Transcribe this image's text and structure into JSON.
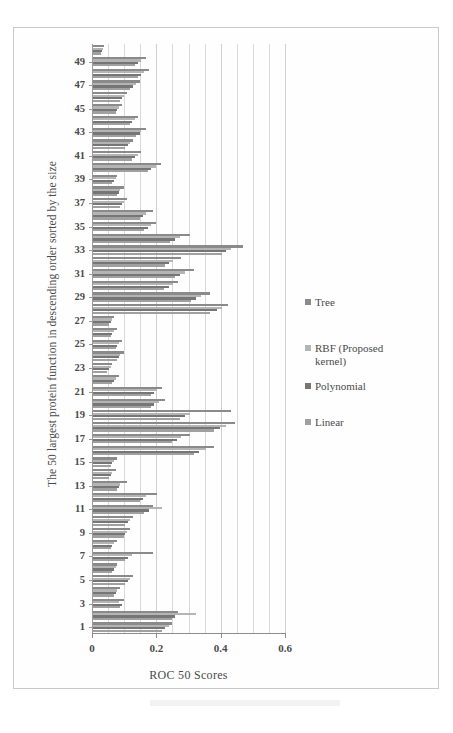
{
  "chart_data": {
    "type": "bar",
    "orientation": "horizontal",
    "title": "",
    "xlabel": "ROC 50 Scores",
    "ylabel": "The 50 largest protein function in descending order sorted by the size",
    "xlim": [
      0,
      0.6
    ],
    "xticks": [
      "0",
      "0.2",
      "0.4",
      "0.6"
    ],
    "xtick_values": [
      0,
      0.2,
      0.4,
      0.6
    ],
    "minor_gridline_step": 0.05,
    "grid": true,
    "legend_position": "right",
    "categories": [
      1,
      2,
      3,
      4,
      5,
      6,
      7,
      8,
      9,
      10,
      11,
      12,
      13,
      14,
      15,
      16,
      17,
      18,
      19,
      20,
      21,
      22,
      23,
      24,
      25,
      26,
      27,
      28,
      29,
      30,
      31,
      32,
      33,
      34,
      35,
      36,
      37,
      38,
      39,
      40,
      41,
      42,
      43,
      44,
      45,
      46,
      47,
      48,
      49,
      50
    ],
    "ytick_labels": [
      "1",
      "3",
      "5",
      "7",
      "9",
      "11",
      "13",
      "15",
      "17",
      "19",
      "21",
      "23",
      "25",
      "27",
      "29",
      "31",
      "33",
      "35",
      "37",
      "39",
      "41",
      "43",
      "45",
      "47",
      "49"
    ],
    "series": [
      {
        "name": "Tree",
        "color": "#8a8a8a",
        "values": [
          0.245,
          0.265,
          0.095,
          0.085,
          0.125,
          0.075,
          0.185,
          0.075,
          0.115,
          0.125,
          0.185,
          0.2,
          0.105,
          0.07,
          0.075,
          0.375,
          0.3,
          0.44,
          0.43,
          0.225,
          0.215,
          0.08,
          0.06,
          0.095,
          0.09,
          0.075,
          0.065,
          0.42,
          0.365,
          0.265,
          0.315,
          0.275,
          0.465,
          0.3,
          0.195,
          0.185,
          0.105,
          0.095,
          0.075,
          0.21,
          0.15,
          0.125,
          0.165,
          0.14,
          0.09,
          0.105,
          0.145,
          0.175,
          0.165,
          0.035
        ]
      },
      {
        "name": "RBF (Proposed kernel)",
        "color": "#b4b4b4",
        "values": [
          0.235,
          0.32,
          0.08,
          0.075,
          0.115,
          0.07,
          0.12,
          0.065,
          0.105,
          0.115,
          0.215,
          0.165,
          0.085,
          0.06,
          0.065,
          0.35,
          0.275,
          0.415,
          0.3,
          0.205,
          0.2,
          0.07,
          0.055,
          0.085,
          0.08,
          0.065,
          0.06,
          0.4,
          0.335,
          0.25,
          0.285,
          0.25,
          0.43,
          0.27,
          0.18,
          0.165,
          0.095,
          0.085,
          0.07,
          0.195,
          0.14,
          0.115,
          0.15,
          0.13,
          0.08,
          0.095,
          0.135,
          0.16,
          0.15,
          0.03
        ]
      },
      {
        "name": "Polynomial",
        "color": "#767676",
        "values": [
          0.225,
          0.255,
          0.09,
          0.07,
          0.11,
          0.065,
          0.11,
          0.06,
          0.1,
          0.11,
          0.175,
          0.155,
          0.08,
          0.055,
          0.06,
          0.33,
          0.26,
          0.395,
          0.285,
          0.19,
          0.19,
          0.065,
          0.05,
          0.08,
          0.075,
          0.06,
          0.055,
          0.385,
          0.32,
          0.235,
          0.27,
          0.235,
          0.415,
          0.255,
          0.17,
          0.155,
          0.09,
          0.08,
          0.065,
          0.18,
          0.13,
          0.11,
          0.145,
          0.12,
          0.075,
          0.09,
          0.125,
          0.15,
          0.14,
          0.028
        ]
      },
      {
        "name": "Linear",
        "color": "#a0a0a0",
        "values": [
          0.215,
          0.245,
          0.085,
          0.065,
          0.1,
          0.06,
          0.1,
          0.055,
          0.095,
          0.1,
          0.16,
          0.145,
          0.075,
          0.05,
          0.055,
          0.315,
          0.245,
          0.375,
          0.27,
          0.18,
          0.18,
          0.06,
          0.045,
          0.075,
          0.07,
          0.055,
          0.05,
          0.365,
          0.305,
          0.22,
          0.255,
          0.225,
          0.4,
          0.24,
          0.16,
          0.145,
          0.085,
          0.075,
          0.06,
          0.17,
          0.12,
          0.1,
          0.135,
          0.115,
          0.07,
          0.085,
          0.115,
          0.14,
          0.13,
          0.025
        ]
      }
    ]
  },
  "legend": {
    "entries": [
      {
        "label": "Tree"
      },
      {
        "label": "RBF (Proposed\nkernel)"
      },
      {
        "label": "Polynomial"
      },
      {
        "label": "Linear"
      }
    ]
  }
}
